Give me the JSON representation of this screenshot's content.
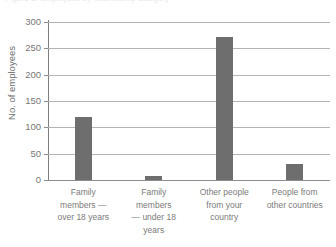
{
  "caption": {
    "text": "Figure 2: Employees by relationship category"
  },
  "chart_data": {
    "type": "bar",
    "title": "",
    "xlabel": "",
    "ylabel": "No. of employees",
    "ylim": [
      0,
      300
    ],
    "yticks": [
      0,
      50,
      100,
      150,
      200,
      250,
      300
    ],
    "ytick_labels": [
      "0",
      "50",
      "100",
      "150",
      "200",
      "250",
      "300"
    ],
    "grid": true,
    "legend": "none",
    "bar_color": "#6e6e6e",
    "gridline_color": "#b4b4b4",
    "axis_color": "#7d7d7d",
    "categories": [
      "Family members — over 18 years",
      "Family members — under 18 years",
      "Other people from your country",
      "People from other countries"
    ],
    "category_lines": [
      [
        "Family",
        "members —",
        "over 18 years"
      ],
      [
        "Family",
        "members",
        "— under 18",
        "years"
      ],
      [
        "Other people",
        "from your",
        "country"
      ],
      [
        "People from",
        "other countries"
      ]
    ],
    "values": [
      120,
      8,
      272,
      30
    ]
  }
}
